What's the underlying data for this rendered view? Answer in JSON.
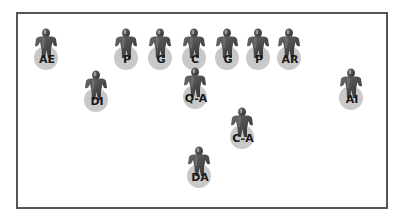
{
  "diagram": {
    "type": "formation",
    "border_color": "#555555",
    "player_color": "#4a4a4a",
    "disc_color": "#c9c9c9",
    "players": [
      {
        "label": "AE",
        "x": 30,
        "y": 28
      },
      {
        "label": "P",
        "x": 110,
        "y": 28
      },
      {
        "label": "G",
        "x": 144,
        "y": 28
      },
      {
        "label": "C",
        "x": 178,
        "y": 28
      },
      {
        "label": "G",
        "x": 211,
        "y": 28
      },
      {
        "label": "P",
        "x": 242,
        "y": 28
      },
      {
        "label": "AR",
        "x": 273,
        "y": 28
      },
      {
        "label": "DI",
        "x": 80,
        "y": 70
      },
      {
        "label": "Q-A",
        "x": 179,
        "y": 67
      },
      {
        "label": "AI",
        "x": 335,
        "y": 68
      },
      {
        "label": "C-A",
        "x": 226,
        "y": 107
      },
      {
        "label": "DA",
        "x": 183,
        "y": 146
      }
    ]
  }
}
